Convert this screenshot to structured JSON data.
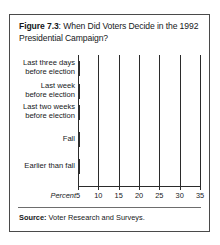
{
  "figure": {
    "label": "Figure 7.3",
    "title_separator": ": ",
    "title": "When Did Voters Decide in the 1992 Presidential Campaign?",
    "source_label": "Source:",
    "source_text": " Voter Research and Surveys."
  },
  "colors": {
    "bar_fill": "#ababab",
    "bar_stroke": "#2e2e2e",
    "frame": "#4a4a4a",
    "text": "#16181a",
    "background": "#ffffff"
  },
  "chart_data": {
    "type": "bar",
    "orientation": "horizontal",
    "title": "Figure 7.3: When Did Voters Decide in the 1992 Presidential Campaign?",
    "categories": [
      "Last three days\nbefore election",
      "Last week\nbefore election",
      "Last two weeks\nbefore election",
      "Fall",
      "Earlier than fall"
    ],
    "category_lines": [
      [
        "Last three days",
        "before election"
      ],
      [
        "Last week",
        "before election"
      ],
      [
        "Last two weeks",
        "before election"
      ],
      [
        "Fall",
        ""
      ],
      [
        "Earlier than fall",
        ""
      ]
    ],
    "values": [
      16,
      8,
      18,
      24,
      33
    ],
    "xlabel": "Percent",
    "ylabel": "",
    "xlim": [
      5,
      35
    ],
    "xticks": [
      5,
      10,
      15,
      20,
      25,
      30,
      35
    ],
    "xtick_labels": [
      "5",
      "10",
      "15",
      "20",
      "25",
      "30",
      "35"
    ],
    "grid": "vertical",
    "legend": "none"
  }
}
